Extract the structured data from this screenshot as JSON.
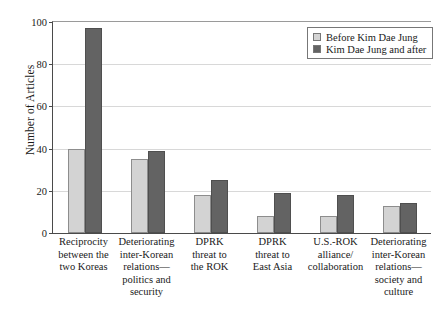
{
  "chart_data": {
    "type": "bar",
    "title": "",
    "xlabel": "",
    "ylabel": "Number of Articles",
    "ylim": [
      0,
      100
    ],
    "yticks": [
      0,
      20,
      40,
      60,
      80,
      100
    ],
    "grid": true,
    "legend_position": "top-right",
    "categories": [
      "Reciprocity\nbetween the\ntwo Koreas",
      "Deteriorating\ninter-Korean\nrelations—\npolitics and\nsecurity",
      "DPRK\nthreat to\nthe ROK",
      "DPRK\nthreat to\nEast Asia",
      "U.S.-ROK\nalliance/\ncollaboration",
      "Deteriorating\ninter-Korean\nrelations—\nsociety and\nculture"
    ],
    "series": [
      {
        "name": "Before Kim Dae Jung",
        "color": "#d3d3d3",
        "values": [
          40,
          35,
          18,
          8,
          8,
          13
        ]
      },
      {
        "name": "Kim Dae Jung and after",
        "color": "#636363",
        "values": [
          97,
          39,
          25,
          19,
          18,
          14
        ]
      }
    ]
  },
  "legend": {
    "items": [
      {
        "label": "Before Kim Dae Jung",
        "swatch": "light"
      },
      {
        "label": "Kim Dae Jung and after",
        "swatch": "dark"
      }
    ]
  }
}
